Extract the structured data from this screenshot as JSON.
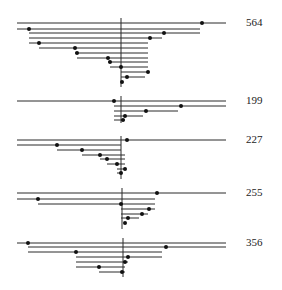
{
  "diagram": {
    "type": "horizontal-line-tree-groups",
    "line_color": "#2a2a2a",
    "dot_color": "#111111",
    "groups": [
      {
        "label": "564",
        "label_pos": [
          246,
          17
        ],
        "axis": {
          "x": 121,
          "y1": 18,
          "y2": 87
        },
        "rows": [
          {
            "y": 23,
            "x1": 17,
            "x2": 226,
            "dot": 202
          },
          {
            "y": 29,
            "x1": 17,
            "x2": 200,
            "dot": 29
          },
          {
            "y": 33,
            "x1": 29,
            "x2": 200,
            "dot": 164
          },
          {
            "y": 38,
            "x1": 29,
            "x2": 162,
            "dot": 150
          },
          {
            "y": 43,
            "x1": 29,
            "x2": 148,
            "dot": 39
          },
          {
            "y": 48,
            "x1": 39,
            "x2": 148,
            "dot": 75
          },
          {
            "y": 53,
            "x1": 75,
            "x2": 148,
            "dot": 77
          },
          {
            "y": 58,
            "x1": 77,
            "x2": 148,
            "dot": 108
          },
          {
            "y": 62,
            "x1": 108,
            "x2": 148,
            "dot": 110
          },
          {
            "y": 67,
            "x1": 110,
            "x2": 148,
            "dot": 121
          },
          {
            "y": 72,
            "x1": 121,
            "x2": 148,
            "dot": 148
          },
          {
            "y": 77,
            "x1": 121,
            "x2": 145,
            "dot": 127
          },
          {
            "y": 82,
            "x1": 121,
            "x2": 121,
            "dot": 122
          }
        ]
      },
      {
        "label": "199",
        "label_pos": [
          246,
          95
        ],
        "axis": {
          "x": 121,
          "y1": 96,
          "y2": 123
        },
        "rows": [
          {
            "y": 101,
            "x1": 17,
            "x2": 226,
            "dot": 114
          },
          {
            "y": 106,
            "x1": 114,
            "x2": 226,
            "dot": 181
          },
          {
            "y": 111,
            "x1": 114,
            "x2": 178,
            "dot": 146
          },
          {
            "y": 116,
            "x1": 114,
            "x2": 143,
            "dot": 125
          },
          {
            "y": 120,
            "x1": 114,
            "x2": 125,
            "dot": 123
          }
        ]
      },
      {
        "label": "227",
        "label_pos": [
          246,
          134
        ],
        "axis": {
          "x": 121,
          "y1": 136,
          "y2": 179
        },
        "rows": [
          {
            "y": 140,
            "x1": 17,
            "x2": 226,
            "dot": 127
          },
          {
            "y": 145,
            "x1": 17,
            "x2": 121,
            "dot": 57
          },
          {
            "y": 150,
            "x1": 57,
            "x2": 121,
            "dot": 82
          },
          {
            "y": 155,
            "x1": 82,
            "x2": 125,
            "dot": 100
          },
          {
            "y": 159,
            "x1": 100,
            "x2": 125,
            "dot": 107
          },
          {
            "y": 164,
            "x1": 107,
            "x2": 125,
            "dot": 117
          },
          {
            "y": 169,
            "x1": 117,
            "x2": 125,
            "dot": 125
          },
          {
            "y": 173,
            "x1": 117,
            "x2": 122,
            "dot": 121
          }
        ]
      },
      {
        "label": "255",
        "label_pos": [
          246,
          187
        ],
        "axis": {
          "x": 122,
          "y1": 188,
          "y2": 229
        },
        "rows": [
          {
            "y": 193,
            "x1": 17,
            "x2": 226,
            "dot": 157
          },
          {
            "y": 199,
            "x1": 17,
            "x2": 155,
            "dot": 38
          },
          {
            "y": 204,
            "x1": 38,
            "x2": 155,
            "dot": 121
          },
          {
            "y": 209,
            "x1": 121,
            "x2": 155,
            "dot": 149
          },
          {
            "y": 214,
            "x1": 121,
            "x2": 148,
            "dot": 142
          },
          {
            "y": 218,
            "x1": 121,
            "x2": 139,
            "dot": 128
          },
          {
            "y": 223,
            "x1": 121,
            "x2": 121,
            "dot": 125
          }
        ]
      },
      {
        "label": "356",
        "label_pos": [
          246,
          237
        ],
        "axis": {
          "x": 123,
          "y1": 238,
          "y2": 277
        },
        "rows": [
          {
            "y": 243,
            "x1": 17,
            "x2": 226,
            "dot": 28
          },
          {
            "y": 247,
            "x1": 28,
            "x2": 226,
            "dot": 166
          },
          {
            "y": 252,
            "x1": 28,
            "x2": 162,
            "dot": 76
          },
          {
            "y": 257,
            "x1": 76,
            "x2": 162,
            "dot": 128
          },
          {
            "y": 262,
            "x1": 76,
            "x2": 128,
            "dot": 125
          },
          {
            "y": 267,
            "x1": 76,
            "x2": 125,
            "dot": 99
          },
          {
            "y": 272,
            "x1": 99,
            "x2": 125,
            "dot": 122
          }
        ]
      }
    ]
  }
}
